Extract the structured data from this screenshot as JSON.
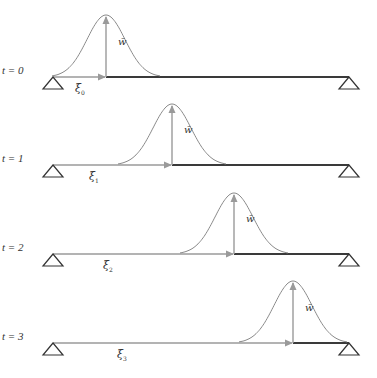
{
  "figure": {
    "colors": {
      "beam": "#3a3a3a",
      "arrow": "#9a9a9a",
      "curve": "#8a8a8a",
      "support": "#333333",
      "text": "#333333"
    },
    "load_label": "w̄",
    "panels": [
      {
        "time_label": "t = 0",
        "position_label": "ξ",
        "position_sub": "0",
        "beam_y": 77,
        "peak_x": 106,
        "peak_y": 15
      },
      {
        "time_label": "t = 1",
        "position_label": "ξ",
        "position_sub": "1",
        "beam_y": 165,
        "peak_x": 172,
        "peak_y": 104
      },
      {
        "time_label": "t = 2",
        "position_label": "ξ",
        "position_sub": "2",
        "beam_y": 254,
        "peak_x": 234,
        "peak_y": 193
      },
      {
        "time_label": "t = 3",
        "position_label": "ξ",
        "position_sub": "3",
        "beam_y": 343,
        "peak_x": 293,
        "peak_y": 281
      }
    ],
    "beam": {
      "left_x": 53,
      "right_x": 349
    }
  }
}
